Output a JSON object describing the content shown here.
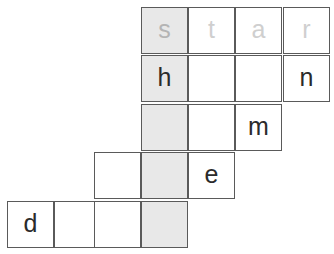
{
  "puzzle": {
    "kind": "word-ladder-grid",
    "geometry": {
      "cell_size": 47,
      "col_x": [
        7,
        54,
        94,
        141,
        188,
        235,
        283,
        330
      ],
      "row_y": [
        7,
        55,
        104,
        152,
        201,
        250
      ],
      "border_color": "#5a5a5a",
      "shaded_fill": "#e8e8e8",
      "letter_color": "#2b2b2b",
      "faded_letter_color": "#cfcfcf",
      "highlight_column_index": 3
    },
    "rows": [
      {
        "row": 1,
        "cells": [
          {
            "col": 3,
            "letter": "s",
            "shaded": true,
            "faded": true
          },
          {
            "col": 4,
            "letter": "t",
            "shaded": false,
            "faded": true
          },
          {
            "col": 5,
            "letter": "a",
            "shaded": false,
            "faded": true
          },
          {
            "col": 6,
            "letter": "r",
            "shaded": false,
            "faded": true
          }
        ]
      },
      {
        "row": 2,
        "cells": [
          {
            "col": 3,
            "letter": "h",
            "shaded": true,
            "faded": false
          },
          {
            "col": 4,
            "letter": "",
            "shaded": false,
            "faded": false
          },
          {
            "col": 5,
            "letter": "",
            "shaded": false,
            "faded": false
          },
          {
            "col": 6,
            "letter": "n",
            "shaded": false,
            "faded": false
          }
        ]
      },
      {
        "row": 3,
        "cells": [
          {
            "col": 3,
            "letter": "",
            "shaded": true,
            "faded": false
          },
          {
            "col": 4,
            "letter": "",
            "shaded": false,
            "faded": false
          },
          {
            "col": 5,
            "letter": "m",
            "shaded": false,
            "faded": false
          }
        ]
      },
      {
        "row": 4,
        "cells": [
          {
            "col": 2,
            "letter": "",
            "shaded": false,
            "faded": false
          },
          {
            "col": 3,
            "letter": "",
            "shaded": true,
            "faded": false
          },
          {
            "col": 4,
            "letter": "e",
            "shaded": false,
            "faded": false
          }
        ]
      },
      {
        "row": 5,
        "cells": [
          {
            "col": 0,
            "letter": "d",
            "shaded": false,
            "faded": false
          },
          {
            "col": 1,
            "letter": "",
            "shaded": false,
            "faded": false
          },
          {
            "col": 2,
            "letter": "",
            "shaded": false,
            "faded": false
          },
          {
            "col": 3,
            "letter": "",
            "shaded": true,
            "faded": false
          }
        ]
      }
    ]
  }
}
